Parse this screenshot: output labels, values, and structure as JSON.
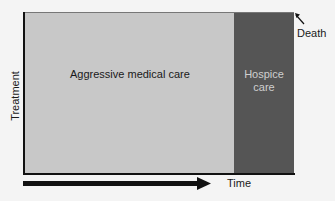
{
  "diagram": {
    "blocks": [
      {
        "label": "Aggressive medical care",
        "color": "#c8c8c8"
      },
      {
        "label_line1": "Hospice",
        "label_line2": "care",
        "color": "#555555"
      }
    ],
    "y_axis_label": "Treatment",
    "x_axis_label": "Time",
    "annotation": "Death",
    "icons": {
      "time_arrow": "right-arrow-icon",
      "death_pointer": "up-left-arrow-icon"
    }
  }
}
